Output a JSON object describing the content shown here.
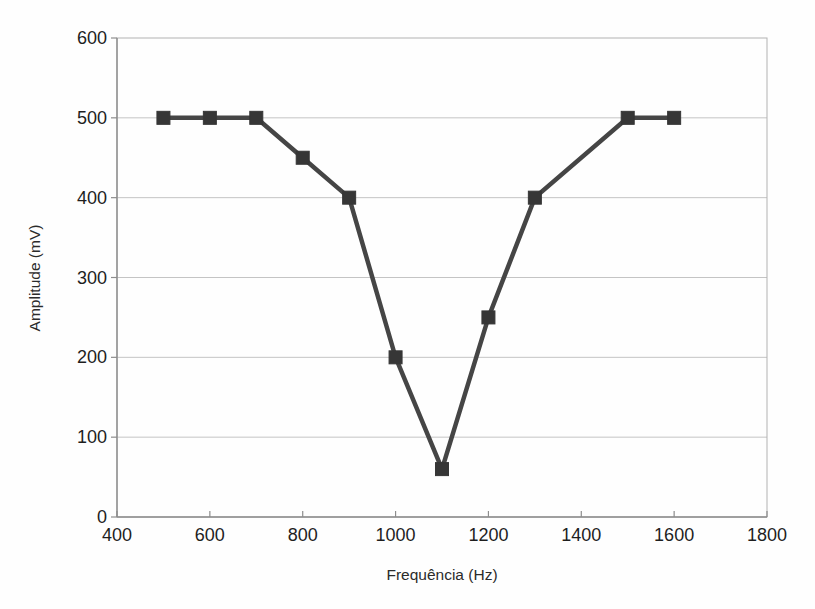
{
  "chart_data": {
    "type": "line",
    "title": "",
    "xlabel": "Frequência (Hz)",
    "ylabel": "Amplitude (mV)",
    "x": [
      500,
      600,
      700,
      800,
      900,
      1000,
      1100,
      1200,
      1300,
      1500,
      1600
    ],
    "y": [
      500,
      500,
      500,
      450,
      400,
      200,
      60,
      250,
      400,
      500,
      500
    ],
    "xlim": [
      400,
      1800
    ],
    "ylim": [
      0,
      600
    ],
    "x_ticks": [
      400,
      600,
      800,
      1000,
      1200,
      1400,
      1600,
      1800
    ],
    "y_ticks": [
      0,
      100,
      200,
      300,
      400,
      500,
      600
    ],
    "grid": "horizontal",
    "legend": "none",
    "marker": "square",
    "colors": {
      "line": "#454545",
      "marker": "#363636",
      "grid": "#c4c4c4",
      "border": "#b2b2b2",
      "axis": "#8d8d8d",
      "tick_text": "#1e1e1e",
      "axis_title_text": "#2b2b2b",
      "background": "#fefefe"
    }
  }
}
